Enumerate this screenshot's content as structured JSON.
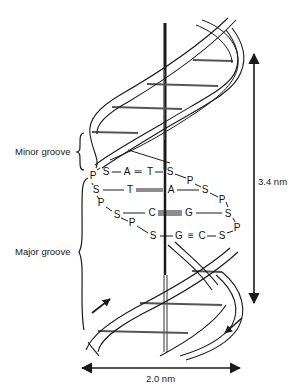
{
  "diagram": {
    "labels": {
      "minor_groove": "Minor groove",
      "major_groove": "Major groove",
      "pitch": "3.4 nm",
      "diameter": "2.0 nm"
    },
    "colors": {
      "ink": "#1a1a1a",
      "background": "#ffffff",
      "rung": "#555555"
    },
    "base_pairs": [
      {
        "left_sugar": "S",
        "left_base": "A",
        "bond": "=",
        "right_base": "T",
        "right_sugar": "S"
      },
      {
        "left_sugar": "S",
        "left_base": "T",
        "bond": "=",
        "right_base": "A",
        "right_sugar": "S"
      },
      {
        "left_sugar": "S",
        "left_base": "C",
        "bond": "≡",
        "right_base": "G",
        "right_sugar": "S"
      },
      {
        "left_sugar": "S",
        "left_base": "G",
        "bond": "≡",
        "right_base": "C",
        "right_sugar": "S"
      }
    ],
    "backbone_symbols": {
      "phosphate": "P",
      "sugar": "S"
    },
    "glyphs": [
      {
        "t": "P",
        "x": 93,
        "y": 176
      },
      {
        "t": "S",
        "x": 106,
        "y": 172
      },
      {
        "t": "A",
        "x": 127,
        "y": 172
      },
      {
        "t": "═",
        "x": 138,
        "y": 172
      },
      {
        "t": "T",
        "x": 150,
        "y": 172
      },
      {
        "t": "S",
        "x": 170,
        "y": 172
      },
      {
        "t": "P",
        "x": 190,
        "y": 181
      },
      {
        "t": "S",
        "x": 96,
        "y": 190
      },
      {
        "t": "T",
        "x": 130,
        "y": 190
      },
      {
        "t": "A",
        "x": 171,
        "y": 190
      },
      {
        "t": "S",
        "x": 205,
        "y": 190
      },
      {
        "t": "P",
        "x": 222,
        "y": 200
      },
      {
        "t": "P",
        "x": 101,
        "y": 203
      },
      {
        "t": "S",
        "x": 117,
        "y": 215
      },
      {
        "t": "C",
        "x": 152,
        "y": 213
      },
      {
        "t": "G",
        "x": 189,
        "y": 213
      },
      {
        "t": "S",
        "x": 228,
        "y": 214
      },
      {
        "t": "P",
        "x": 237,
        "y": 228
      },
      {
        "t": "P",
        "x": 132,
        "y": 223
      },
      {
        "t": "S",
        "x": 153,
        "y": 236
      },
      {
        "t": "G",
        "x": 179,
        "y": 236
      },
      {
        "t": "≡",
        "x": 191,
        "y": 236
      },
      {
        "t": "C",
        "x": 202,
        "y": 236
      },
      {
        "t": "S",
        "x": 222,
        "y": 236
      }
    ]
  }
}
